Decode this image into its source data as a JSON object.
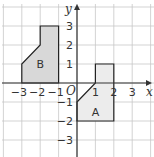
{
  "diagram": {
    "type": "coordinate-grid",
    "axes": {
      "x_label": "x",
      "y_label": "y",
      "origin_label": "O",
      "x_ticks": [
        {
          "value": -3,
          "label": "−3"
        },
        {
          "value": -2,
          "label": "−2"
        },
        {
          "value": -1,
          "label": "−1"
        },
        {
          "value": 1,
          "label": "1"
        },
        {
          "value": 2,
          "label": "2"
        },
        {
          "value": 3,
          "label": "3"
        }
      ],
      "y_ticks": [
        {
          "value": 3,
          "label": "3"
        },
        {
          "value": 2,
          "label": "2"
        },
        {
          "value": 1,
          "label": "1"
        },
        {
          "value": -1,
          "label": "−1"
        },
        {
          "value": -2,
          "label": "−2"
        },
        {
          "value": -3,
          "label": "−3"
        }
      ]
    },
    "shapes": [
      {
        "name": "B",
        "label": "B",
        "fill": "#d8d8d8",
        "stroke": "#222222",
        "vertices": [
          [
            -3,
            0
          ],
          [
            -3,
            1
          ],
          [
            -2,
            2
          ],
          [
            -2,
            3
          ],
          [
            -1,
            3
          ],
          [
            -1,
            0
          ]
        ],
        "label_pos": [
          -2,
          1
        ]
      },
      {
        "name": "A",
        "label": "A",
        "fill": "#ececec",
        "stroke": "#222222",
        "vertices": [
          [
            0,
            -1
          ],
          [
            1,
            0
          ],
          [
            1,
            1
          ],
          [
            2,
            1
          ],
          [
            2,
            -2
          ],
          [
            0,
            -2
          ]
        ],
        "label_pos": [
          1,
          -1.5
        ]
      }
    ],
    "colors": {
      "grid": "#c8c8c8",
      "axis": "#333333",
      "background": "#ffffff"
    }
  }
}
